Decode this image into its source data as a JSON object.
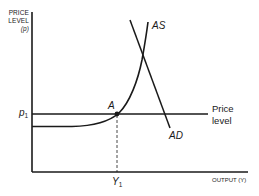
{
  "diagram": {
    "type": "economics-supply-demand",
    "y_axis": {
      "label_line1": "PRICE",
      "label_line2": "LEVEL",
      "label_line3": "(p)"
    },
    "x_axis": {
      "label": "OUTPUT (Y)"
    },
    "curves": {
      "as_label": "AS",
      "ad_label": "AD",
      "price_line_label_line1": "Price",
      "price_line_label_line2": "level"
    },
    "points": {
      "equilibrium_label": "A",
      "p1_main": "p",
      "p1_sub": "1",
      "y1_main": "Y",
      "y1_sub": "1"
    },
    "colors": {
      "line": "#1a1a1a",
      "background": "#ffffff"
    }
  }
}
